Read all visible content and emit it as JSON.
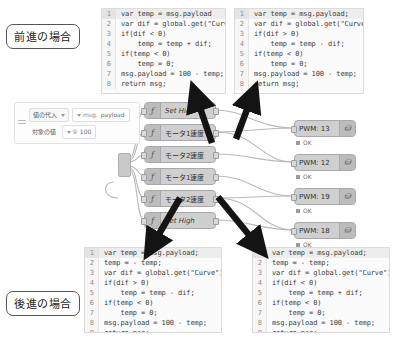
{
  "annotations": {
    "forward_label": "前進の場合",
    "reverse_label": "後進の場合"
  },
  "code_panels": {
    "top_left": {
      "name": "forward-left-function-code",
      "lines": [
        {
          "n": "1",
          "text": "var temp = msg.payload"
        },
        {
          "n": "2",
          "text": "var dif = global.get(\"Curve\");"
        },
        {
          "n": "3",
          "text": "if(dif < 0)"
        },
        {
          "n": "4",
          "text": "    temp = temp + dif;"
        },
        {
          "n": "5",
          "text": "if(temp < 0)"
        },
        {
          "n": "6",
          "text": "    temp = 0;"
        },
        {
          "n": "7",
          "text": "msg.payload = 100 - temp;"
        },
        {
          "n": "8",
          "text": "return msg;"
        }
      ]
    },
    "top_right": {
      "name": "forward-right-function-code",
      "lines": [
        {
          "n": "1",
          "text": "var temp = msg.payload;"
        },
        {
          "n": "2",
          "text": "var dif = global.get(\"Curve\");"
        },
        {
          "n": "3",
          "text": "if(dif > 0)"
        },
        {
          "n": "4",
          "text": "    temp = temp - dif;"
        },
        {
          "n": "5",
          "text": "if(temp < 0)"
        },
        {
          "n": "6",
          "text": "    temp = 0;"
        },
        {
          "n": "7",
          "text": "msg.payload = 100 - temp;"
        },
        {
          "n": "8",
          "text": "return msg;"
        }
      ]
    },
    "bottom_left": {
      "name": "reverse-left-function-code",
      "lines": [
        {
          "n": "1",
          "text": "var temp = msg.payload;"
        },
        {
          "n": "2",
          "text": "temp = - temp;"
        },
        {
          "n": "3",
          "text": "var dif = global.get(\"Curve\");"
        },
        {
          "n": "4",
          "text": "if(dif > 0)"
        },
        {
          "n": "5",
          "text": "    temp = temp - dif;"
        },
        {
          "n": "6",
          "text": "if(temp < 0)"
        },
        {
          "n": "7",
          "text": "    temp = 0;"
        },
        {
          "n": "8",
          "text": "msg.payload = 100 - temp;"
        },
        {
          "n": "9",
          "text": "return msg;"
        }
      ]
    },
    "bottom_right": {
      "name": "reverse-right-function-code",
      "lines": [
        {
          "n": "1",
          "text": "var temp = msg.payload;"
        },
        {
          "n": "2",
          "text": "temp = - temp;"
        },
        {
          "n": "3",
          "text": "var dif = global.get(\"Curve\");"
        },
        {
          "n": "4",
          "text": "if(dif < 0)"
        },
        {
          "n": "5",
          "text": "    temp = temp + dif;"
        },
        {
          "n": "6",
          "text": "if(temp < 0)"
        },
        {
          "n": "7",
          "text": "    temp = 0;"
        },
        {
          "n": "8",
          "text": "msg.payload = 100 - temp;"
        },
        {
          "n": "9",
          "text": "return msg;"
        }
      ]
    }
  },
  "change_editor": {
    "rule_action": "値の代入",
    "rule_property_type": "msg.",
    "rule_property": "payload",
    "target_label": "対象の値",
    "target_type": "9",
    "target_value": "100"
  },
  "flow_nodes": [
    {
      "label": "Set High",
      "icon": "f",
      "style": "italic"
    },
    {
      "label": "モータ1速度",
      "icon": "f",
      "style": "normal"
    },
    {
      "label": "モータ2速度",
      "icon": "f",
      "style": "normal"
    },
    {
      "label": "モータ1速度",
      "icon": "f",
      "style": "normal"
    },
    {
      "label": "モータ2速度",
      "icon": "f",
      "style": "normal"
    },
    {
      "label": "Set High",
      "icon": "f",
      "style": "italic"
    }
  ],
  "pwm_nodes": [
    {
      "label": "PWM: 13",
      "status": "OK"
    },
    {
      "label": "PWM: 12",
      "status": "OK"
    },
    {
      "label": "PWM: 19",
      "status": "OK"
    },
    {
      "label": "PWM: 18",
      "status": "OK"
    }
  ],
  "colors": {
    "node_fill": "#cfcfcf",
    "node_border": "#a9a9a9",
    "wire": "#b5b5b5",
    "arrow": "#1a1a1a",
    "code_bg": "#fbfbfb",
    "gutter": "#f6f6f6"
  }
}
